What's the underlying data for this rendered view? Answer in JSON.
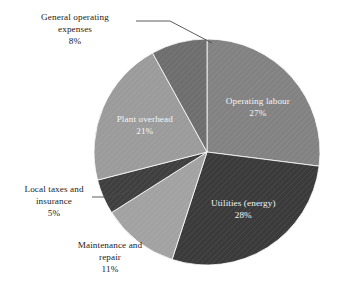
{
  "chart_data": {
    "type": "pie",
    "title": "",
    "subtitle": "",
    "xlabel": "",
    "ylabel": "",
    "legend": "none",
    "grid": false,
    "units": "%",
    "start_angle_deg": 0,
    "direction": "clockwise",
    "categories": [
      "Operating labour",
      "Utilities (energy)",
      "Maintenance and repair",
      "Local taxes and insurance",
      "Plant overhead",
      "General operating expenses"
    ],
    "values": [
      27,
      28,
      11,
      5,
      21,
      8
    ],
    "slices": [
      {
        "label": "Operating labour",
        "label_line1": "Operating labour",
        "value": 27,
        "pct_text": "27%",
        "color": "#828282",
        "label_placement": "inside",
        "text_color": "#f4f4f4"
      },
      {
        "label": "Utilities (energy)",
        "label_line1": "Utilities (energy)",
        "value": 28,
        "pct_text": "28%",
        "color": "#3a3a3a",
        "label_placement": "inside",
        "text_color": "#f4f4f4"
      },
      {
        "label": "Maintenance and repair",
        "label_line1": "Maintenance and",
        "label_line2": "repair",
        "value": 11,
        "pct_text": "11%",
        "color": "#a2a2a2",
        "label_placement": "outside",
        "text_color": "#1b1b1b"
      },
      {
        "label": "Local taxes and insurance",
        "label_line1": "Local taxes and",
        "label_line2": "insurance",
        "value": 5,
        "pct_text": "5%",
        "color": "#3f3f3f",
        "label_placement": "outside",
        "text_color": "#1b1b1b"
      },
      {
        "label": "Plant overhead",
        "label_line1": "Plant overhead",
        "value": 21,
        "pct_text": "21%",
        "color": "#9b9b9b",
        "label_placement": "inside",
        "text_color": "#f4f4f4"
      },
      {
        "label": "General operating expenses",
        "label_line1": "General operating",
        "label_line2": "expenses",
        "value": 8,
        "pct_text": "8%",
        "color": "#6e6e6e",
        "label_placement": "outside",
        "text_color": "#1b1b1b"
      }
    ],
    "geometry": {
      "center_x": 207,
      "center_y": 152,
      "radius": 113
    },
    "background_color": "#ffffff",
    "leader_line_color": "#4a4a4a"
  }
}
